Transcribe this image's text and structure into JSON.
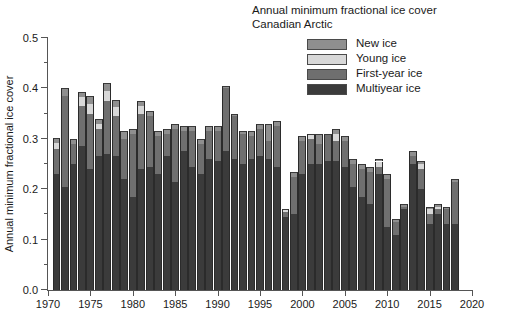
{
  "chart_data": {
    "type": "bar",
    "title": "Annual minimum fractional ice cover",
    "subtitle": "Canadian Arctic",
    "xlabel": "",
    "ylabel": "Annual minimum fractional ice cover",
    "xlim": [
      1970,
      2020
    ],
    "ylim": [
      0.0,
      0.5
    ],
    "ytick_labels": [
      "0.0",
      "0.1",
      "0.2",
      "0.3",
      "0.4",
      "0.5"
    ],
    "ytick_values": [
      0.0,
      0.1,
      0.2,
      0.3,
      0.4,
      0.5
    ],
    "yminor_step": 0.05,
    "xtick_labels": [
      "1970",
      "1975",
      "1980",
      "1985",
      "1990",
      "1995",
      "2000",
      "2005",
      "2010",
      "2015",
      "2020"
    ],
    "xtick_values": [
      1970,
      1975,
      1980,
      1985,
      1990,
      1995,
      2000,
      2005,
      2010,
      2015,
      2020
    ],
    "grid": false,
    "stacked": true,
    "legend_position": "top-right",
    "legend": [
      "New ice",
      "Young ice",
      "First-year ice",
      "Multiyear ice"
    ],
    "colors": {
      "new_ice": "#8f8f8f",
      "young_ice": "#d8d8d8",
      "first_year_ice": "#6f6f6f",
      "multiyear_ice": "#3b3b3b",
      "axis": "#555555",
      "text": "#1a1a1a"
    },
    "x": [
      1971,
      1972,
      1973,
      1974,
      1975,
      1976,
      1977,
      1978,
      1979,
      1980,
      1981,
      1982,
      1983,
      1984,
      1985,
      1986,
      1987,
      1988,
      1989,
      1990,
      1991,
      1992,
      1993,
      1994,
      1995,
      1996,
      1997,
      1998,
      1999,
      2000,
      2001,
      2002,
      2003,
      2004,
      2005,
      2006,
      2007,
      2008,
      2009,
      2010,
      2011,
      2012,
      2013,
      2014,
      2015,
      2016,
      2017,
      2018
    ],
    "series": [
      {
        "name": "Multiyear ice",
        "values": [
          0.23,
          0.205,
          0.25,
          0.285,
          0.24,
          0.265,
          0.27,
          0.265,
          0.22,
          0.185,
          0.24,
          0.245,
          0.23,
          0.265,
          0.215,
          0.275,
          0.245,
          0.23,
          0.26,
          0.255,
          0.275,
          0.26,
          0.25,
          0.26,
          0.265,
          0.26,
          0.245,
          0.145,
          0.15,
          0.23,
          0.25,
          0.25,
          0.255,
          0.255,
          0.245,
          0.205,
          0.185,
          0.17,
          0.23,
          0.125,
          0.11,
          0.16,
          0.25,
          0.2,
          0.13,
          0.15,
          0.13,
          0.13
        ]
      },
      {
        "name": "First-year ice",
        "values": [
          0.05,
          0.18,
          0.04,
          0.08,
          0.11,
          0.055,
          0.105,
          0.08,
          0.08,
          0.125,
          0.11,
          0.1,
          0.075,
          0.045,
          0.105,
          0.04,
          0.07,
          0.06,
          0.055,
          0.06,
          0.125,
          0.085,
          0.06,
          0.045,
          0.055,
          0.035,
          0.08,
          0.01,
          0.075,
          0.065,
          0.05,
          0.04,
          0.055,
          0.04,
          0.05,
          0.045,
          0.055,
          0.065,
          0.015,
          0.095,
          0.025,
          0.005,
          0.015,
          0.04,
          0.02,
          0.01,
          0.03,
          0.085
        ]
      },
      {
        "name": "Young ice",
        "values": [
          0.012,
          0.0,
          0.0,
          0.018,
          0.02,
          0.01,
          0.02,
          0.018,
          0.0,
          0.0,
          0.015,
          0.0,
          0.0,
          0.0,
          0.0,
          0.0,
          0.0,
          0.0,
          0.0,
          0.0,
          0.0,
          0.0,
          0.0,
          0.0,
          0.0,
          0.0,
          0.0,
          0.005,
          0.0,
          0.0,
          0.01,
          0.0,
          0.0,
          0.015,
          0.0,
          0.0,
          0.0,
          0.0,
          0.01,
          0.0,
          0.0,
          0.0,
          0.0,
          0.01,
          0.01,
          0.005,
          0.0,
          0.0
        ]
      },
      {
        "name": "New ice",
        "values": [
          0.01,
          0.015,
          0.01,
          0.01,
          0.015,
          0.01,
          0.015,
          0.015,
          0.015,
          0.01,
          0.01,
          0.01,
          0.01,
          0.01,
          0.01,
          0.01,
          0.01,
          0.01,
          0.01,
          0.01,
          0.005,
          0.005,
          0.005,
          0.01,
          0.01,
          0.035,
          0.01,
          0.0,
          0.01,
          0.01,
          0.0,
          0.02,
          0.0,
          0.01,
          0.01,
          0.01,
          0.01,
          0.01,
          0.005,
          0.01,
          0.005,
          0.005,
          0.01,
          0.005,
          0.005,
          0.005,
          0.005,
          0.005
        ]
      }
    ]
  },
  "legend_items": [
    {
      "label": "New ice",
      "color": "#8f8f8f"
    },
    {
      "label": "Young ice",
      "color": "#d8d8d8"
    },
    {
      "label": "First-year ice",
      "color": "#6f6f6f"
    },
    {
      "label": "Multiyear ice",
      "color": "#3b3b3b"
    }
  ]
}
